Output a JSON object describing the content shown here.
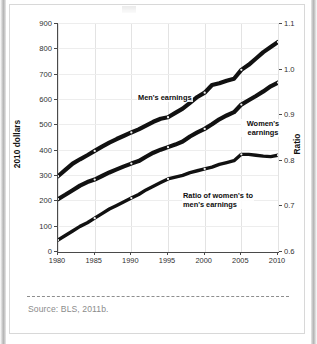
{
  "figure": {
    "source_note": "Source:  BLS, 2011b."
  },
  "chart_data": {
    "type": "line",
    "title": "",
    "xlabel": "",
    "ylabel": "2010 dollars",
    "y2label": "Ratio",
    "grid": true,
    "legend": "inline-labels",
    "x": [
      1980,
      1981,
      1982,
      1983,
      1984,
      1985,
      1986,
      1987,
      1988,
      1989,
      1990,
      1991,
      1992,
      1993,
      1994,
      1995,
      1996,
      1997,
      1998,
      1999,
      2000,
      2001,
      2002,
      2003,
      2004,
      2005,
      2006,
      2007,
      2008,
      2009,
      2010
    ],
    "xticks": [
      1980,
      1985,
      1990,
      1995,
      2000,
      2005,
      2010
    ],
    "xticklabels": [
      "1980",
      "1985",
      "1990",
      "1995",
      "2000",
      "2005",
      "2010"
    ],
    "xlim": [
      1980,
      2010
    ],
    "ylim": [
      0,
      900
    ],
    "yticks": [
      0,
      100,
      200,
      300,
      400,
      500,
      600,
      700,
      800,
      900
    ],
    "yticklabels": [
      "0",
      "100",
      "200",
      "300",
      "400",
      "500",
      "600",
      "700",
      "800",
      "900"
    ],
    "y2lim": [
      0.6,
      1.1
    ],
    "y2ticks": [
      0.6,
      0.7,
      0.8,
      0.9,
      1.0,
      1.1
    ],
    "y2ticklabels": [
      "0.6",
      "0.7",
      "0.8",
      "0.9",
      "1.0",
      "1.1"
    ],
    "series": [
      {
        "name": "Men's earnings",
        "axis": "left",
        "label_text": "Men's earnings",
        "values": [
          295,
          320,
          345,
          362,
          378,
          395,
          412,
          428,
          442,
          455,
          468,
          480,
          495,
          510,
          522,
          528,
          545,
          562,
          585,
          608,
          625,
          655,
          662,
          672,
          680,
          715,
          735,
          760,
          785,
          805,
          825
        ]
      },
      {
        "name": "Women's earnings",
        "axis": "left",
        "label_text": "Women's earnings",
        "values": [
          205,
          222,
          240,
          258,
          272,
          282,
          296,
          310,
          322,
          334,
          345,
          355,
          372,
          388,
          400,
          410,
          420,
          432,
          452,
          468,
          482,
          500,
          520,
          535,
          548,
          578,
          595,
          612,
          630,
          650,
          665
        ]
      },
      {
        "name": "Ratio of women's to men's earnings",
        "axis": "right",
        "label_text": "Ratio of women's to men's earnings",
        "values": [
          0.624,
          0.634,
          0.644,
          0.654,
          0.662,
          0.672,
          0.682,
          0.692,
          0.7,
          0.708,
          0.716,
          0.724,
          0.734,
          0.742,
          0.75,
          0.758,
          0.762,
          0.766,
          0.772,
          0.776,
          0.78,
          0.784,
          0.79,
          0.794,
          0.798,
          0.812,
          0.812,
          0.81,
          0.808,
          0.807,
          0.81
        ]
      }
    ]
  }
}
